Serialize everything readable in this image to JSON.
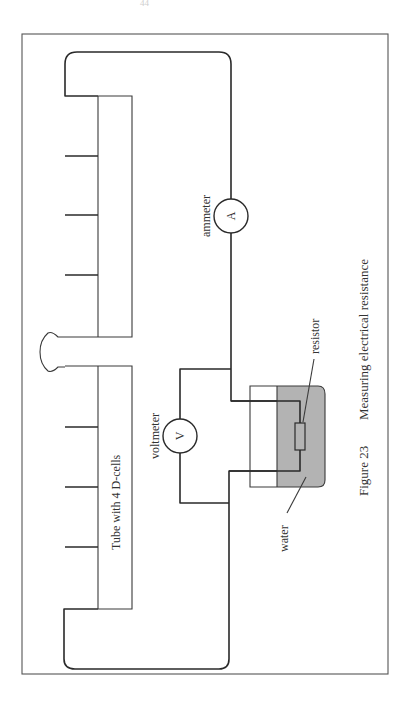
{
  "page": {
    "number": "44"
  },
  "figure": {
    "number_label": "Figure 23",
    "title": "Measuring electrical resistance",
    "caption": "Figure 23   Measuring electrical resistance"
  },
  "labels": {
    "tube": "Tube with 4 D-cells",
    "ammeter": "ammeter",
    "ammeter_symbol": "A",
    "voltmeter": "voltmeter",
    "voltmeter_symbol": "V",
    "resistor": "resistor",
    "water": "water"
  },
  "colors": {
    "line": "#2a2a2a",
    "water_fill": "#b3b3b3",
    "frame": "#555555",
    "text": "#333333"
  }
}
